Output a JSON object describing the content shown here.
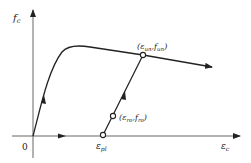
{
  "diagram": {
    "type": "stress-strain schematic",
    "axes": {
      "y_label": {
        "main": "f",
        "sub": "c"
      },
      "x_label": {
        "main": "ε",
        "sub": "c"
      },
      "origin_label": "0"
    },
    "points": {
      "plastic_strain": {
        "main": "ε",
        "sub": "pl"
      },
      "unloading": {
        "open": "(",
        "e": "ε",
        "e_sub": "un",
        "comma": ",",
        "f": "f",
        "f_sub": "un",
        "close": ")"
      },
      "reloading": {
        "open": "(",
        "e": "ε",
        "e_sub": "ro",
        "comma": ",",
        "f": "f",
        "f_sub": "ro",
        "close": ")"
      }
    },
    "colors": {
      "line": "#222222",
      "axis": "#555555",
      "background": "#ffffff"
    }
  }
}
